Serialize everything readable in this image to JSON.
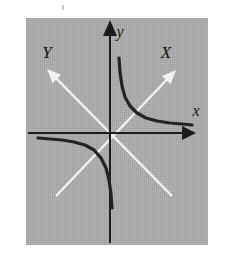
{
  "figure": {
    "kind": "math-diagram",
    "background_color": "#ffffff",
    "panel_color": "#a9a9a9",
    "panel": {
      "x": 26,
      "y": 18,
      "width": 182,
      "height": 227
    }
  },
  "axes": {
    "original": {
      "color": "#1c1c1c",
      "x_axis": {
        "label": "x",
        "label_x": 196,
        "label_y": 116,
        "y": 133,
        "x_start": 28,
        "x_end": 186,
        "arrow": "right"
      },
      "y_axis": {
        "label": "y",
        "label_x": 120,
        "label_y": 37,
        "x": 110,
        "y_start": 243,
        "y_end": 30,
        "arrow": "up"
      },
      "origin": {
        "x": 110,
        "y": 133
      }
    },
    "rotated": {
      "color": "#f2f2f2",
      "X_axis": {
        "label": "X",
        "label_x": 166,
        "label_y": 58,
        "tail": {
          "x": 56,
          "y": 196
        },
        "tip": {
          "x": 176,
          "y": 70
        },
        "arrow": "up-right"
      },
      "Y_axis": {
        "label": "Y",
        "label_x": 47,
        "label_y": 58,
        "tail": {
          "x": 172,
          "y": 196
        },
        "tip": {
          "x": 47,
          "y": 69
        },
        "arrow": "up-left"
      }
    }
  },
  "chart_data": {
    "type": "line",
    "title": "",
    "xlabel": "x",
    "ylabel": "y",
    "curve_label": "xy = k",
    "curve_color": "#232323",
    "branches": [
      {
        "name": "branch-quadrant-I",
        "quadrant": 1,
        "points": [
          [
            119,
            58
          ],
          [
            120,
            72
          ],
          [
            122,
            86
          ],
          [
            125,
            97
          ],
          [
            130,
            106
          ],
          [
            137,
            113
          ],
          [
            146,
            118
          ],
          [
            157,
            121
          ],
          [
            170,
            123
          ],
          [
            182,
            124
          ],
          [
            192,
            125
          ]
        ]
      },
      {
        "name": "branch-quadrant-III",
        "quadrant": 3,
        "points": [
          [
            38,
            138
          ],
          [
            50,
            139
          ],
          [
            62,
            140
          ],
          [
            74,
            142
          ],
          [
            85,
            145
          ],
          [
            94,
            150
          ],
          [
            101,
            158
          ],
          [
            106,
            168
          ],
          [
            109,
            180
          ],
          [
            111,
            194
          ],
          [
            112,
            208
          ]
        ]
      }
    ]
  },
  "artifacts": {
    "speck": {
      "x": 62,
      "y": 5,
      "color": "#c9c9c9"
    }
  }
}
